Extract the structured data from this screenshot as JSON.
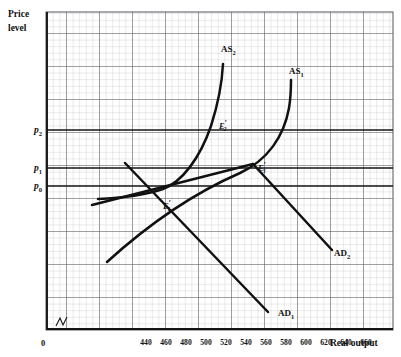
{
  "figure": {
    "axes": {
      "y_label_line1": "Price",
      "y_label_line2": "level",
      "x_label": "Real output",
      "origin_label": "0"
    },
    "y_ticks": [
      {
        "name": "p2",
        "base": "p",
        "sub": "2",
        "y": 130
      },
      {
        "name": "p1",
        "base": "p",
        "sub": "1",
        "y": 168
      },
      {
        "name": "p0",
        "base": "p",
        "sub": "0",
        "y": 186
      }
    ],
    "x_ticks": [
      {
        "label": "440",
        "x": 146
      },
      {
        "label": "460",
        "x": 166
      },
      {
        "label": "480",
        "x": 186
      },
      {
        "label": "500",
        "x": 206
      },
      {
        "label": "520",
        "x": 226
      },
      {
        "label": "540",
        "x": 246
      },
      {
        "label": "560",
        "x": 266
      },
      {
        "label": "580",
        "x": 286
      },
      {
        "label": "600",
        "x": 306
      },
      {
        "label": "620",
        "x": 326
      },
      {
        "label": "640",
        "x": 346
      },
      {
        "label": "660",
        "x": 366
      }
    ],
    "curve_labels": [
      {
        "name": "AS2",
        "base": "AS",
        "sub": "2",
        "x": 221,
        "y": 52
      },
      {
        "name": "AS1",
        "base": "AS",
        "sub": "1",
        "x": 289,
        "y": 74
      },
      {
        "name": "AD2",
        "base": "AD",
        "sub": "2",
        "x": 334,
        "y": 256
      },
      {
        "name": "AD1",
        "base": "AD",
        "sub": "1",
        "x": 278,
        "y": 316
      }
    ],
    "equilibria": [
      {
        "name": "E1",
        "base": "E",
        "sub": "1",
        "prime": "′",
        "x": 163,
        "y": 209,
        "px": 168,
        "py": 186
      },
      {
        "name": "E2",
        "base": "E",
        "sub": "2",
        "prime": "′",
        "x": 219,
        "y": 129,
        "px": 214,
        "py": 122
      },
      {
        "name": "E3",
        "base": "E",
        "sub": "3",
        "prime": "′",
        "x": 258,
        "y": 171,
        "px": 253,
        "py": 164
      }
    ],
    "colors": {
      "grid_minor": "#b9b9bd",
      "grid_major": "#4a4a50",
      "axis": "#1a1a1a",
      "curve": "#111111",
      "paper": "#ffffff"
    }
  },
  "chart_data": {
    "type": "line",
    "title": "",
    "xlabel": "Real output",
    "ylabel": "Price level",
    "xlim": [
      420,
      680
    ],
    "ylim": [
      0,
      1
    ],
    "grid": true,
    "legend": "inline-curve-labels",
    "xtick_labels": [
      "440",
      "460",
      "480",
      "500",
      "520",
      "540",
      "560",
      "580",
      "600",
      "620",
      "640",
      "660"
    ],
    "ytick_labels": [
      "p0",
      "p1",
      "p2"
    ],
    "series": [
      {
        "name": "AD1",
        "kind": "demand-line",
        "points_px": [
          [
            125,
            163
          ],
          [
            163,
            209
          ],
          [
            200,
            249
          ],
          [
            240,
            290
          ],
          [
            268,
            312
          ]
        ]
      },
      {
        "name": "AD2",
        "kind": "demand-line",
        "points_px": [
          [
            92,
            205
          ],
          [
            163,
            209
          ],
          [
            253,
            164
          ],
          [
            300,
            225
          ],
          [
            330,
            250
          ]
        ]
      },
      {
        "name": "AS1",
        "kind": "supply-curve",
        "points_px": [
          [
            107,
            262
          ],
          [
            140,
            226
          ],
          [
            163,
            209
          ],
          [
            210,
            184
          ],
          [
            253,
            164
          ],
          [
            275,
            140
          ],
          [
            288,
            105
          ],
          [
            291,
            82
          ]
        ]
      },
      {
        "name": "AS2",
        "kind": "supply-curve",
        "points_px": [
          [
            98,
            199
          ],
          [
            140,
            194
          ],
          [
            163,
            209
          ],
          [
            196,
            173
          ],
          [
            214,
            122
          ],
          [
            221,
            88
          ],
          [
            223,
            64
          ]
        ]
      }
    ],
    "annotations": [
      {
        "text": "E1'",
        "at_px": [
          168,
          186
        ],
        "meaning": "initial equilibrium at p0"
      },
      {
        "text": "E2'",
        "at_px": [
          214,
          122
        ],
        "meaning": "equilibrium AD2 x AS2 at p2"
      },
      {
        "text": "E3'",
        "at_px": [
          253,
          164
        ],
        "meaning": "equilibrium AD2 x AS1 at p1"
      }
    ]
  }
}
